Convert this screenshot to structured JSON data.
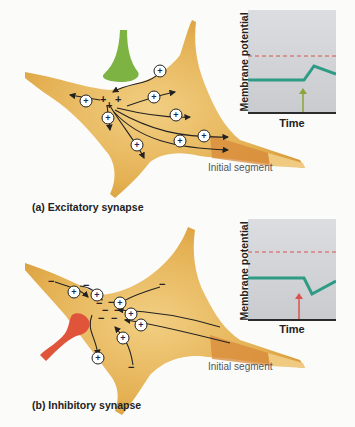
{
  "panels": {
    "a": {
      "caption": "(a) Excitatory synapse",
      "segment_label": "Initial segment",
      "graph": {
        "ylabel": "Membrane potential",
        "xlabel": "Time",
        "trace": "depolarization (EPSP)",
        "arrow_color": "#8aa63a",
        "trace_color": "#2e9c84",
        "threshold_color": "#d9534f"
      },
      "ion_symbol": "+",
      "terminal_color": "#7cb342"
    },
    "b": {
      "caption": "(b) Inhibitory synapse",
      "segment_label": "Initial segment",
      "graph": {
        "ylabel": "Membrane potential",
        "xlabel": "Time",
        "trace": "hyperpolarization (IPSP)",
        "arrow_color": "#d9534f",
        "trace_color": "#2e9c84",
        "threshold_color": "#d9534f"
      },
      "ion_symbol": "+",
      "charge_symbol": "−",
      "terminal_color": "#e0553a"
    }
  },
  "colors": {
    "soma": "#e3ad4a",
    "soma_light": "#efc877",
    "initial_segment": "#d8893a",
    "axon_light": "#edc47a"
  }
}
